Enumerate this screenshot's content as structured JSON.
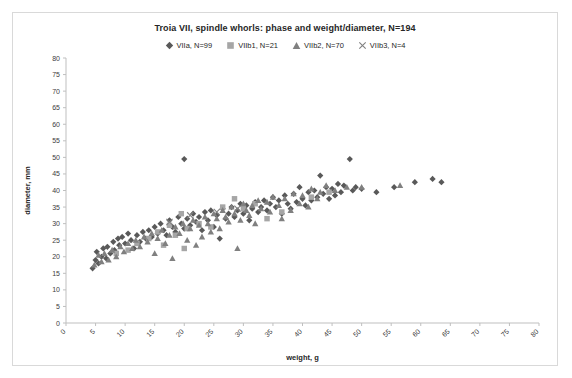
{
  "chart_data": {
    "type": "scatter",
    "title": "Troia VII, spindle whorls: phase and weight/diameter, N=194",
    "xlabel": "weight, g",
    "ylabel": "diameter, mm",
    "xlim": [
      0,
      80
    ],
    "ylim": [
      0,
      80
    ],
    "xticks": [
      0,
      5,
      10,
      15,
      20,
      25,
      30,
      35,
      40,
      45,
      50,
      55,
      60,
      65,
      70,
      75,
      80
    ],
    "yticks": [
      0,
      5,
      10,
      15,
      20,
      25,
      30,
      35,
      40,
      45,
      50,
      55,
      60,
      65,
      70,
      75,
      80
    ],
    "grid": false,
    "legend_position": "top",
    "series": [
      {
        "name": "VIIa, N=99",
        "marker": "diamond",
        "color": "#595959",
        "points": [
          [
            4.5,
            16.5
          ],
          [
            5.0,
            19.0
          ],
          [
            5.2,
            21.5
          ],
          [
            5.5,
            18.0
          ],
          [
            6.0,
            20.0
          ],
          [
            6.3,
            22.5
          ],
          [
            6.8,
            19.5
          ],
          [
            7.0,
            23.0
          ],
          [
            7.5,
            21.0
          ],
          [
            8.0,
            24.5
          ],
          [
            8.2,
            22.0
          ],
          [
            8.8,
            25.5
          ],
          [
            9.0,
            23.5
          ],
          [
            9.5,
            26.0
          ],
          [
            10.0,
            24.0
          ],
          [
            10.5,
            27.0
          ],
          [
            11.0,
            25.0
          ],
          [
            11.5,
            22.5
          ],
          [
            12.0,
            26.5
          ],
          [
            12.5,
            24.5
          ],
          [
            13.0,
            27.5
          ],
          [
            13.5,
            25.5
          ],
          [
            14.0,
            28.0
          ],
          [
            14.5,
            26.0
          ],
          [
            15.0,
            29.0
          ],
          [
            15.5,
            27.0
          ],
          [
            16.0,
            30.0
          ],
          [
            16.5,
            28.0
          ],
          [
            17.0,
            26.5
          ],
          [
            17.5,
            31.0
          ],
          [
            18.0,
            29.0
          ],
          [
            18.5,
            27.5
          ],
          [
            19.0,
            32.0
          ],
          [
            19.5,
            30.0
          ],
          [
            20.0,
            49.5
          ],
          [
            20.0,
            28.5
          ],
          [
            20.5,
            31.5
          ],
          [
            21.0,
            29.5
          ],
          [
            21.5,
            33.0
          ],
          [
            22.0,
            30.5
          ],
          [
            22.5,
            32.0
          ],
          [
            23.0,
            28.0
          ],
          [
            23.5,
            33.5
          ],
          [
            24.0,
            31.0
          ],
          [
            24.5,
            34.0
          ],
          [
            25.0,
            29.0
          ],
          [
            25.5,
            32.5
          ],
          [
            26.0,
            25.5
          ],
          [
            26.5,
            34.5
          ],
          [
            27.0,
            31.5
          ],
          [
            27.5,
            33.0
          ],
          [
            28.0,
            35.0
          ],
          [
            28.5,
            32.0
          ],
          [
            29.0,
            34.0
          ],
          [
            29.5,
            36.0
          ],
          [
            30.0,
            33.0
          ],
          [
            30.5,
            35.5
          ],
          [
            31.0,
            31.0
          ],
          [
            31.5,
            34.5
          ],
          [
            32.0,
            36.5
          ],
          [
            32.5,
            33.5
          ],
          [
            33.0,
            35.0
          ],
          [
            33.5,
            37.0
          ],
          [
            34.0,
            34.0
          ],
          [
            34.5,
            36.0
          ],
          [
            35.0,
            38.0
          ],
          [
            35.5,
            35.0
          ],
          [
            36.0,
            37.0
          ],
          [
            36.5,
            33.0
          ],
          [
            37.0,
            38.5
          ],
          [
            37.5,
            36.0
          ],
          [
            38.0,
            34.5
          ],
          [
            38.5,
            39.0
          ],
          [
            39.0,
            36.5
          ],
          [
            39.5,
            41.0
          ],
          [
            40.0,
            37.5
          ],
          [
            40.5,
            35.5
          ],
          [
            41.0,
            39.5
          ],
          [
            41.5,
            37.0
          ],
          [
            42.0,
            40.0
          ],
          [
            42.5,
            38.0
          ],
          [
            43.0,
            44.5
          ],
          [
            43.5,
            39.0
          ],
          [
            44.0,
            41.0
          ],
          [
            44.5,
            37.5
          ],
          [
            45.0,
            40.5
          ],
          [
            45.5,
            38.5
          ],
          [
            46.0,
            42.0
          ],
          [
            46.5,
            39.5
          ],
          [
            47.0,
            41.5
          ],
          [
            48.0,
            49.5
          ],
          [
            48.5,
            40.0
          ],
          [
            49.0,
            41.0
          ],
          [
            50.0,
            40.5
          ],
          [
            52.5,
            39.5
          ],
          [
            55.5,
            41.0
          ],
          [
            59.0,
            42.5
          ],
          [
            62.0,
            43.5
          ],
          [
            63.5,
            42.5
          ]
        ]
      },
      {
        "name": "VIIb1, N=21",
        "marker": "square",
        "color": "#a6a6a6",
        "points": [
          [
            8.5,
            21.0
          ],
          [
            10.5,
            22.0
          ],
          [
            12.0,
            24.0
          ],
          [
            14.0,
            25.5
          ],
          [
            15.5,
            27.5
          ],
          [
            16.5,
            23.5
          ],
          [
            17.5,
            29.5
          ],
          [
            18.5,
            26.5
          ],
          [
            19.5,
            33.0
          ],
          [
            20.0,
            22.5
          ],
          [
            20.5,
            28.5
          ],
          [
            22.5,
            30.0
          ],
          [
            24.5,
            29.0
          ],
          [
            26.5,
            35.0
          ],
          [
            28.5,
            37.5
          ],
          [
            30.0,
            34.5
          ],
          [
            32.0,
            36.0
          ],
          [
            34.0,
            31.5
          ],
          [
            36.5,
            33.5
          ],
          [
            41.5,
            38.0
          ],
          [
            44.5,
            39.5
          ]
        ]
      },
      {
        "name": "VIIb2, N=70",
        "marker": "triangle",
        "color": "#808080",
        "points": [
          [
            4.8,
            17.5
          ],
          [
            5.5,
            20.5
          ],
          [
            6.0,
            18.5
          ],
          [
            6.5,
            21.0
          ],
          [
            7.2,
            19.0
          ],
          [
            7.8,
            22.0
          ],
          [
            8.5,
            20.0
          ],
          [
            9.2,
            23.0
          ],
          [
            9.8,
            21.5
          ],
          [
            10.5,
            24.0
          ],
          [
            11.2,
            22.5
          ],
          [
            11.8,
            25.0
          ],
          [
            12.5,
            23.0
          ],
          [
            13.2,
            26.0
          ],
          [
            13.8,
            24.5
          ],
          [
            14.5,
            27.0
          ],
          [
            15.0,
            21.0
          ],
          [
            15.5,
            25.5
          ],
          [
            16.2,
            28.0
          ],
          [
            16.8,
            24.0
          ],
          [
            17.5,
            26.5
          ],
          [
            18.0,
            19.5
          ],
          [
            18.5,
            29.0
          ],
          [
            19.2,
            27.0
          ],
          [
            19.8,
            30.0
          ],
          [
            20.5,
            25.0
          ],
          [
            21.0,
            28.5
          ],
          [
            21.5,
            31.0
          ],
          [
            22.0,
            23.5
          ],
          [
            22.5,
            29.5
          ],
          [
            23.0,
            26.0
          ],
          [
            23.5,
            32.0
          ],
          [
            24.0,
            30.0
          ],
          [
            24.5,
            27.5
          ],
          [
            25.0,
            33.0
          ],
          [
            25.5,
            31.5
          ],
          [
            26.0,
            28.5
          ],
          [
            26.5,
            34.0
          ],
          [
            27.0,
            32.0
          ],
          [
            27.5,
            30.5
          ],
          [
            28.0,
            35.0
          ],
          [
            28.5,
            33.0
          ],
          [
            29.0,
            22.5
          ],
          [
            29.5,
            31.0
          ],
          [
            30.0,
            36.0
          ],
          [
            30.5,
            34.0
          ],
          [
            31.0,
            32.5
          ],
          [
            31.5,
            35.5
          ],
          [
            32.0,
            30.0
          ],
          [
            32.5,
            37.0
          ],
          [
            33.0,
            34.5
          ],
          [
            34.0,
            36.5
          ],
          [
            34.5,
            33.5
          ],
          [
            35.0,
            38.0
          ],
          [
            36.0,
            35.5
          ],
          [
            36.5,
            31.5
          ],
          [
            37.0,
            37.5
          ],
          [
            38.0,
            34.0
          ],
          [
            38.5,
            39.0
          ],
          [
            39.5,
            36.0
          ],
          [
            40.0,
            38.5
          ],
          [
            41.0,
            35.0
          ],
          [
            41.5,
            40.5
          ],
          [
            42.5,
            37.5
          ],
          [
            43.0,
            39.5
          ],
          [
            44.0,
            41.5
          ],
          [
            45.5,
            40.0
          ],
          [
            47.5,
            41.0
          ],
          [
            50.0,
            41.0
          ],
          [
            56.5,
            41.5
          ]
        ]
      },
      {
        "name": "VIIb3, N=4",
        "marker": "cross",
        "color": "#808080",
        "points": [
          [
            17.5,
            30.5
          ],
          [
            21.0,
            32.5
          ],
          [
            25.5,
            33.5
          ],
          [
            29.0,
            34.5
          ]
        ]
      }
    ]
  }
}
